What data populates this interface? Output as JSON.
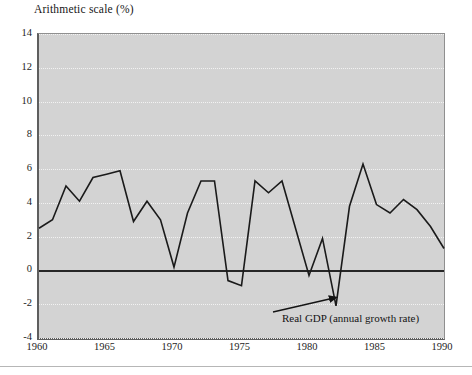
{
  "figure": {
    "title": "Arithmetic scale (%)"
  },
  "annotation": {
    "label": "Real GDP (annual growth rate)"
  },
  "axes": {
    "y_ticks": [
      "14",
      "12",
      "10",
      "8",
      "6",
      "4",
      "2",
      "0",
      "-2",
      "-4"
    ],
    "x_ticks": [
      "1960",
      "1965",
      "1970",
      "1975",
      "1980",
      "1985",
      "1990"
    ]
  },
  "colors": {
    "plot_background": "#d3d3d3",
    "series_line": "#1a1a1a",
    "zero_line": "#262626",
    "gridline": "#f2f2f2",
    "axis": "#5e5e5e",
    "page_background": "#ffffff"
  },
  "chart_data": {
    "type": "line",
    "title": "Arithmetic scale (%)",
    "xlabel": "",
    "ylabel": "",
    "xlim": [
      1960,
      1990
    ],
    "ylim": [
      -4,
      14
    ],
    "ytick_values": [
      14,
      12,
      10,
      8,
      6,
      4,
      2,
      0,
      -2,
      -4
    ],
    "xtick_values": [
      1960,
      1965,
      1970,
      1975,
      1980,
      1985,
      1990
    ],
    "grid": true,
    "legend": null,
    "annotations": [
      {
        "text": "Real GDP (annual growth rate)",
        "points_to_x": 1982,
        "points_to_y": -1.6
      }
    ],
    "series": [
      {
        "name": "Real GDP (annual growth rate)",
        "x": [
          1960,
          1961,
          1962,
          1963,
          1964,
          1965,
          1966,
          1967,
          1968,
          1969,
          1970,
          1971,
          1972,
          1973,
          1974,
          1975,
          1976,
          1977,
          1978,
          1979,
          1980,
          1981,
          1982,
          1983,
          1984,
          1985,
          1986,
          1987,
          1988,
          1989,
          1990
        ],
        "values": [
          2.5,
          3.0,
          5.0,
          4.1,
          5.5,
          5.7,
          5.9,
          2.9,
          4.1,
          3.0,
          0.2,
          3.4,
          5.3,
          5.3,
          -0.6,
          -0.9,
          5.3,
          4.6,
          5.3,
          2.5,
          -0.3,
          1.9,
          -2.1,
          3.8,
          6.3,
          3.9,
          3.4,
          4.2,
          3.6,
          2.6,
          1.3
        ]
      }
    ]
  }
}
